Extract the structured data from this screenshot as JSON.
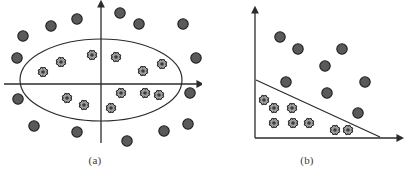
{
  "figure": {
    "background_color": "#ffffff",
    "width": 404,
    "height": 179
  },
  "style": {
    "axis_color": "#2b2b2b",
    "axis_width": 1.3,
    "curve_color": "#2b2b2b",
    "curve_width": 1.2,
    "circle_fill": "#5a5a5a",
    "circle_stroke": "#1c1c1c",
    "circle_radius": 5.2,
    "cross_fill": "#9f9f9f",
    "cross_stroke": "#1a1a1a",
    "cross_size": 8.4,
    "caption_color": "#3a3a3a"
  },
  "legend_semantics": {
    "circle_class": "negative class (outside boundary)",
    "cross_class": "positive class (inside boundary)"
  },
  "panels": [
    {
      "id": "a",
      "caption": "(a)",
      "boundary_type": "ellipse",
      "axes": {
        "type": "cartesian-cross",
        "x_axis": {
          "x1": 4,
          "y1": 84,
          "x2": 198,
          "y2": 84,
          "arrow": "right"
        },
        "y_axis": {
          "x1": 101,
          "y1": 143,
          "x2": 101,
          "y2": 6,
          "arrow": "up"
        }
      },
      "boundary": {
        "cx": 101,
        "cy": 80,
        "rx": 81,
        "ry": 41
      },
      "chart_data": {
        "type": "scatter",
        "title": "(a)",
        "xlabel": "",
        "ylabel": "",
        "grid": false,
        "legend": "none",
        "series": [
          {
            "name": "cross_class",
            "marker": "cross",
            "points": [
              [
                61,
                62
              ],
              [
                43,
                72
              ],
              [
                92,
                55
              ],
              [
                116,
                57
              ],
              [
                143,
                71
              ],
              [
                162,
                64
              ],
              [
                67,
                98
              ],
              [
                84,
                105
              ],
              [
                111,
                108
              ],
              [
                121,
                93
              ],
              [
                145,
                93
              ],
              [
                159,
                95
              ]
            ]
          },
          {
            "name": "circle_class",
            "marker": "circle",
            "points": [
              [
                23,
                36
              ],
              [
                51,
                26
              ],
              [
                77,
                19
              ],
              [
                120,
                13
              ],
              [
                139,
                24
              ],
              [
                183,
                24
              ],
              [
                196,
                58
              ],
              [
                190,
                93
              ],
              [
                17,
                58
              ],
              [
                18,
                99
              ],
              [
                34,
                126
              ],
              [
                77,
                132
              ],
              [
                127,
                141
              ],
              [
                164,
                131
              ],
              [
                188,
                124
              ]
            ]
          }
        ]
      }
    },
    {
      "id": "b",
      "caption": "(b)",
      "boundary_type": "line",
      "axes": {
        "type": "quadrant",
        "x_axis": {
          "x1": 53,
          "y1": 138,
          "x2": 196,
          "y2": 138,
          "arrow": "right"
        },
        "y_axis": {
          "x1": 53,
          "y1": 138,
          "x2": 53,
          "y2": 12,
          "arrow": "up"
        }
      },
      "boundary": {
        "x1": 54,
        "y1": 80,
        "x2": 178,
        "y2": 137
      },
      "chart_data": {
        "type": "scatter",
        "title": "(b)",
        "xlabel": "",
        "ylabel": "",
        "grid": false,
        "legend": "none",
        "series": [
          {
            "name": "cross_class",
            "marker": "cross",
            "points": [
              [
                62,
                100
              ],
              [
                72,
                108
              ],
              [
                90,
                108
              ],
              [
                72,
                123
              ],
              [
                91,
                123
              ],
              [
                107,
                123
              ],
              [
                133,
                130
              ],
              [
                146,
                130
              ]
            ]
          },
          {
            "name": "circle_class",
            "marker": "circle",
            "points": [
              [
                78,
                37
              ],
              [
                96,
                49
              ],
              [
                140,
                49
              ],
              [
                123,
                66
              ],
              [
                84,
                82
              ],
              [
                163,
                82
              ],
              [
                125,
                93
              ],
              [
                156,
                113
              ]
            ]
          }
        ]
      }
    }
  ]
}
